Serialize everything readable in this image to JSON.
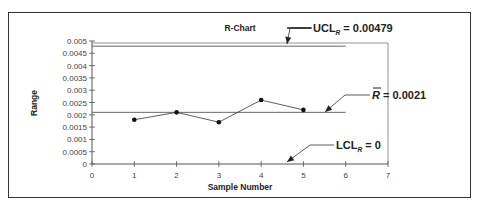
{
  "chart_data": {
    "type": "line",
    "title": "R-Chart",
    "xlabel": "Sample Number",
    "ylabel": "Range",
    "x": [
      1,
      2,
      3,
      4,
      5
    ],
    "series": [
      {
        "name": "Range",
        "values": [
          0.0018,
          0.0021,
          0.0017,
          0.0026,
          0.0022
        ]
      }
    ],
    "xlim": [
      0,
      7
    ],
    "ylim": [
      0,
      0.005
    ],
    "x_ticks": [
      "0",
      "1",
      "2",
      "3",
      "4",
      "5",
      "6",
      "7"
    ],
    "y_ticks": [
      "0",
      "0.0005",
      "0.001",
      "0.0015",
      "0.002",
      "0.0025",
      "0.003",
      "0.0035",
      "0.004",
      "0.0045",
      "0.005"
    ],
    "grid": false,
    "control_lines": [
      {
        "name": "UCL",
        "value": 0.00479,
        "label": "UCL_R = 0.00479"
      },
      {
        "name": "Center",
        "value": 0.0021,
        "label": "R̄ = 0.0021"
      },
      {
        "name": "LCL",
        "value": 0,
        "label": "LCL_R = 0"
      }
    ]
  },
  "labels": {
    "title": "R-Chart",
    "xlabel": "Sample Number",
    "ylabel": "Range",
    "ucl_main": "UCL",
    "ucl_sub": "R",
    "ucl_val": " = 0.00479",
    "rbar_main": "R",
    "rbar_val": " = 0.0021",
    "lcl_main": "LCL",
    "lcl_sub": "R",
    "lcl_val": " = 0"
  }
}
